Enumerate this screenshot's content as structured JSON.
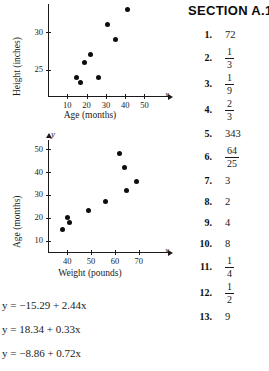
{
  "chart_data": [
    {
      "type": "scatter",
      "title": "",
      "xlabel": "Age (months)",
      "ylabel": "Height (inches)",
      "x_var": "x",
      "y_var": "y",
      "xticks": [
        10,
        20,
        30,
        40,
        50
      ],
      "yticks": [
        25,
        30
      ],
      "xlim": [
        0,
        57
      ],
      "ylim": [
        21.5,
        33.8
      ],
      "grid": false,
      "legend": "none",
      "points": [
        {
          "x": 15,
          "y": 24.0
        },
        {
          "x": 17,
          "y": 23.3
        },
        {
          "x": 19,
          "y": 26.0
        },
        {
          "x": 22,
          "y": 27.0
        },
        {
          "x": 26,
          "y": 24.0
        },
        {
          "x": 31,
          "y": 31.0
        },
        {
          "x": 35,
          "y": 29.0
        },
        {
          "x": 41,
          "y": 33.0
        }
      ]
    },
    {
      "type": "scatter",
      "title": "",
      "xlabel": "Weight (pounds)",
      "ylabel": "Age (months)",
      "x_var": "x",
      "y_var": "y",
      "xticks": [
        40,
        50,
        60,
        70
      ],
      "yticks": [
        10,
        20,
        30,
        40,
        50
      ],
      "xlim": [
        32,
        78
      ],
      "ylim": [
        5,
        54
      ],
      "grid": false,
      "legend": "none",
      "points": [
        {
          "x": 38,
          "y": 15
        },
        {
          "x": 40,
          "y": 20
        },
        {
          "x": 41,
          "y": 18
        },
        {
          "x": 49,
          "y": 23
        },
        {
          "x": 56,
          "y": 27
        },
        {
          "x": 62,
          "y": 48
        },
        {
          "x": 64,
          "y": 42
        },
        {
          "x": 65,
          "y": 32
        },
        {
          "x": 69,
          "y": 36
        }
      ]
    }
  ],
  "equations": [
    "y = −15.29 + 2.44x",
    "y = 18.34 + 0.33x",
    "y = −8.86 + 0.72x"
  ],
  "answers": {
    "section_title": "SECTION A.1",
    "items": [
      {
        "num": "1.",
        "kind": "plain",
        "value": "72"
      },
      {
        "num": "2.",
        "kind": "frac",
        "numerator": "1",
        "denominator": "3"
      },
      {
        "num": "3.",
        "kind": "frac",
        "numerator": "1",
        "denominator": "9"
      },
      {
        "num": "4.",
        "kind": "frac",
        "numerator": "2",
        "denominator": "3"
      },
      {
        "num": "5.",
        "kind": "plain",
        "value": "343"
      },
      {
        "num": "6.",
        "kind": "frac",
        "numerator": "64",
        "denominator": "25"
      },
      {
        "num": "7.",
        "kind": "plain",
        "value": "3"
      },
      {
        "num": "8.",
        "kind": "plain",
        "value": "2"
      },
      {
        "num": "9.",
        "kind": "plain",
        "value": "4"
      },
      {
        "num": "10.",
        "kind": "plain",
        "value": "8"
      },
      {
        "num": "11.",
        "kind": "frac",
        "numerator": "1",
        "denominator": "4"
      },
      {
        "num": "12.",
        "kind": "frac",
        "numerator": "1",
        "denominator": "2"
      },
      {
        "num": "13.",
        "kind": "plain",
        "value": "9"
      }
    ]
  },
  "colors": {
    "ink": "#1a1a1a",
    "dot": "#0d0d0d",
    "paper": "#ffffff"
  }
}
